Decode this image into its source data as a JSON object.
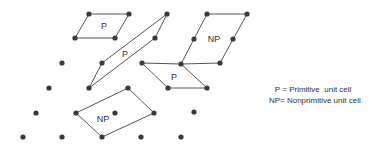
{
  "diagram": {
    "colors": {
      "dot": "#3a3a3a",
      "line": "#555555",
      "text": "#333333"
    },
    "lattice_points": [
      [
        89,
        14
      ],
      [
        129,
        14
      ],
      [
        167,
        14
      ],
      [
        207,
        14
      ],
      [
        247,
        14
      ],
      [
        75,
        38
      ],
      [
        115,
        38
      ],
      [
        155,
        38
      ],
      [
        194,
        39
      ],
      [
        233,
        39
      ],
      [
        62,
        63
      ],
      [
        102,
        63
      ],
      [
        142,
        63
      ],
      [
        181,
        64
      ],
      [
        220,
        63
      ],
      [
        49,
        88
      ],
      [
        89,
        88
      ],
      [
        128,
        88
      ],
      [
        168,
        88
      ],
      [
        207,
        88
      ],
      [
        36,
        113
      ],
      [
        76,
        113
      ],
      [
        115,
        113
      ],
      [
        154,
        113
      ],
      [
        194,
        112
      ],
      [
        23,
        137
      ],
      [
        62,
        137
      ],
      [
        102,
        137
      ],
      [
        141,
        137
      ],
      [
        181,
        137
      ]
    ],
    "cells": [
      {
        "label": "P",
        "type": "primitive",
        "points": [
          [
            89,
            14
          ],
          [
            129,
            14
          ],
          [
            115,
            38
          ],
          [
            75,
            38
          ]
        ],
        "label_pos": [
          104,
          29
        ]
      },
      {
        "label": "P",
        "type": "primitive",
        "points": [
          [
            167,
            14
          ],
          [
            155,
            38
          ],
          [
            89,
            88
          ],
          [
            102,
            63
          ]
        ],
        "label_pos": [
          125,
          57
        ]
      },
      {
        "label": "NP",
        "type": "nonprimitive",
        "points": [
          [
            207,
            14
          ],
          [
            247,
            14
          ],
          [
            220,
            63
          ],
          [
            181,
            64
          ]
        ],
        "label_pos": [
          214,
          42
        ]
      },
      {
        "label": "P",
        "type": "primitive",
        "points": [
          [
            142,
            63
          ],
          [
            181,
            64
          ],
          [
            207,
            88
          ],
          [
            168,
            88
          ]
        ],
        "label_pos": [
          174,
          80
        ]
      },
      {
        "label": "NP",
        "type": "nonprimitive",
        "points": [
          [
            76,
            113
          ],
          [
            128,
            88
          ],
          [
            154,
            113
          ],
          [
            102,
            137
          ]
        ],
        "label_pos": [
          103,
          122
        ]
      }
    ]
  },
  "legend": {
    "items": [
      {
        "key": "P",
        "sep": " = ",
        "text": "Primitive  unit cell"
      },
      {
        "key": "NP",
        "sep": "= ",
        "text": "Nonprimitive unit cell"
      }
    ]
  }
}
